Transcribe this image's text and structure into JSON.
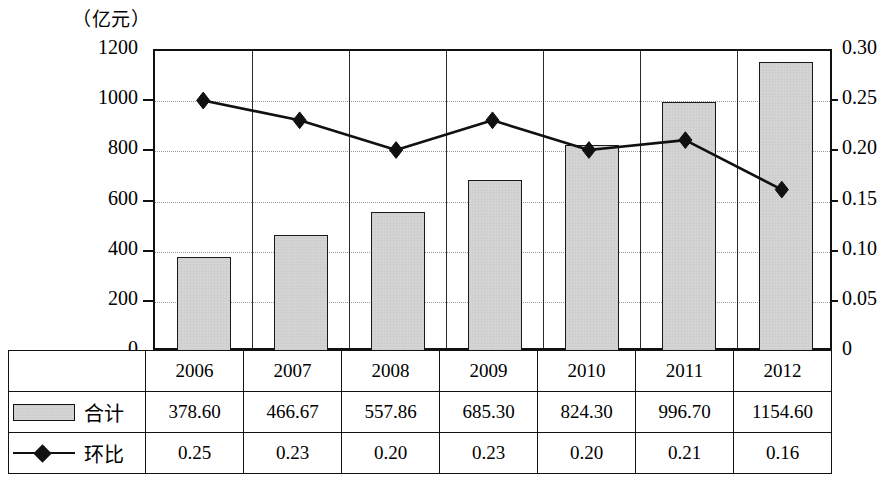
{
  "chart_data": {
    "type": "bar",
    "title": "",
    "subtitle": "",
    "unit_caption": "（亿元）",
    "xlabel": "",
    "ylabel": "",
    "grid": true,
    "legend_position": "table-below",
    "categories": [
      "2006",
      "2007",
      "2008",
      "2009",
      "2010",
      "2011",
      "2012"
    ],
    "series": [
      {
        "name": "合计",
        "type": "bar",
        "axis": "left",
        "values": [
          378.6,
          466.67,
          557.86,
          685.3,
          824.3,
          996.7,
          1154.6
        ],
        "value_labels": [
          "378.60",
          "466.67",
          "557.86",
          "685.30",
          "824.30",
          "996.70",
          "1154.60"
        ],
        "color": "#c9c9c9",
        "edge_color": "#1a1a1a"
      },
      {
        "name": "环比",
        "type": "line",
        "axis": "right",
        "values": [
          0.25,
          0.23,
          0.2,
          0.23,
          0.2,
          0.21,
          0.16
        ],
        "value_labels": [
          "0.25",
          "0.23",
          "0.20",
          "0.23",
          "0.20",
          "0.21",
          "0.16"
        ],
        "color": "#111111",
        "marker": "diamond"
      }
    ],
    "axes": {
      "left": {
        "min": 0,
        "max": 1200,
        "ticks": [
          0,
          200,
          400,
          600,
          800,
          1000,
          1200
        ],
        "tick_labels": [
          "0",
          "200",
          "400",
          "600",
          "800",
          "1000",
          "1200"
        ]
      },
      "right": {
        "min": 0,
        "max": 0.3,
        "ticks": [
          0,
          0.05,
          0.1,
          0.15,
          0.2,
          0.25,
          0.3
        ],
        "tick_labels": [
          "0",
          "0.05",
          "0.10",
          "0.15",
          "0.20",
          "0.25",
          "0.30"
        ]
      }
    }
  },
  "table": {
    "year_header": [
      "2006",
      "2007",
      "2008",
      "2009",
      "2010",
      "2011",
      "2012"
    ],
    "rows": [
      {
        "legend": "合计",
        "swatch": "bar-swatch",
        "values": [
          "378.60",
          "466.67",
          "557.86",
          "685.30",
          "824.30",
          "996.70",
          "1154.60"
        ]
      },
      {
        "legend": "环比",
        "swatch": "line-marker-swatch",
        "values": [
          "0.25",
          "0.23",
          "0.20",
          "0.23",
          "0.20",
          "0.21",
          "0.16"
        ]
      }
    ]
  }
}
